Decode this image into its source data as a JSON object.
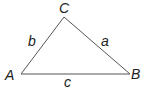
{
  "diagram": {
    "type": "triangle",
    "stroke_color": "#555555",
    "label_color": "#222222",
    "vertices": [
      {
        "name": "A",
        "x": 21,
        "y": 74,
        "label_x": 5,
        "label_y": 80
      },
      {
        "name": "B",
        "x": 130,
        "y": 74,
        "label_x": 131,
        "label_y": 79
      },
      {
        "name": "C",
        "x": 64,
        "y": 17,
        "label_x": 59,
        "label_y": 13
      }
    ],
    "sides": [
      {
        "name": "a",
        "between": "B-C",
        "label_x": 101,
        "label_y": 46
      },
      {
        "name": "b",
        "between": "A-C",
        "label_x": 28,
        "label_y": 46
      },
      {
        "name": "c",
        "between": "A-B",
        "label_x": 64,
        "label_y": 87
      }
    ]
  }
}
